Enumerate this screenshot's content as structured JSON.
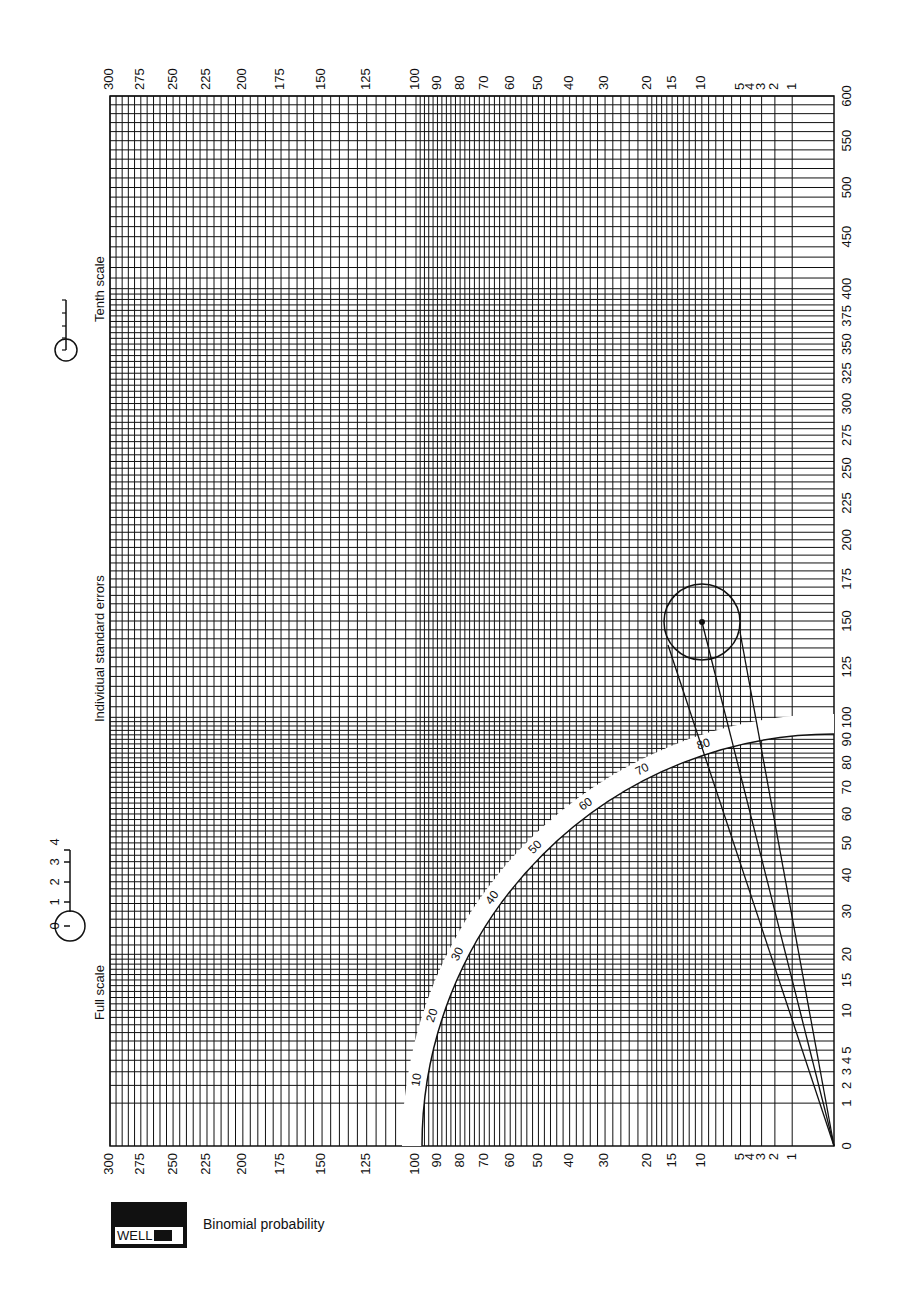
{
  "title": "Binomial probability",
  "logo": {
    "text": "WELL"
  },
  "labels": {
    "full_scale": "Full scale",
    "individual_standard_errors": "Individual standard errors",
    "tenth_scale": "Tenth scale"
  },
  "full_scale_ruler": {
    "ticks": [
      "0",
      "1",
      "2",
      "3",
      "4"
    ]
  },
  "colors": {
    "ink": "#111111",
    "paper": "#ffffff"
  },
  "chart_data": {
    "type": "binomial-probability-paper",
    "title": "Binomial probability",
    "x_axis_right": {
      "ticks": [
        0,
        1,
        2,
        3,
        4,
        5,
        10,
        15,
        20,
        30,
        40,
        50,
        60,
        70,
        80,
        90,
        100,
        125,
        150,
        175,
        200,
        225,
        250,
        275,
        300,
        325,
        350,
        375,
        400,
        450,
        500,
        550,
        600
      ],
      "scale": "sqrt"
    },
    "y_axis_top": {
      "ticks": [
        1,
        2,
        3,
        4,
        5,
        10,
        15,
        20,
        30,
        40,
        50,
        60,
        70,
        80,
        90,
        100,
        125,
        150,
        175,
        200,
        225,
        250,
        275,
        300
      ],
      "scale": "sqrt"
    },
    "y_axis_bottom": {
      "ticks": [
        1,
        2,
        3,
        4,
        5,
        10,
        15,
        20,
        30,
        40,
        50,
        60,
        70,
        80,
        90,
        100,
        125,
        150,
        175,
        200,
        225,
        250,
        275,
        300
      ],
      "scale": "sqrt"
    },
    "quadrant_arc": {
      "ticks": [
        10,
        20,
        30,
        40,
        50,
        60,
        70,
        80
      ],
      "unit": "percent"
    },
    "sample_point": {
      "x": 150,
      "y": 10
    },
    "split_lines_from_origin": 3,
    "annotations": [
      "Full scale",
      "Individual standard errors",
      "Tenth scale"
    ]
  }
}
